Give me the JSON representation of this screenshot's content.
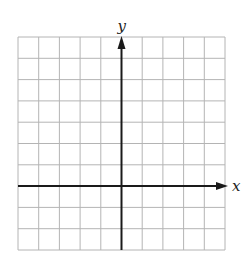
{
  "diagram": {
    "type": "coordinate-plane",
    "x_axis_label": "x",
    "y_axis_label": "y",
    "grid": {
      "columns": 10,
      "rows": 10,
      "left": 18,
      "top": 37,
      "right": 225,
      "bottom": 250,
      "line_color": "#b4b4b4"
    },
    "origin_column": 5,
    "origin_row": 7,
    "axis_color": "#1a1a1a"
  }
}
